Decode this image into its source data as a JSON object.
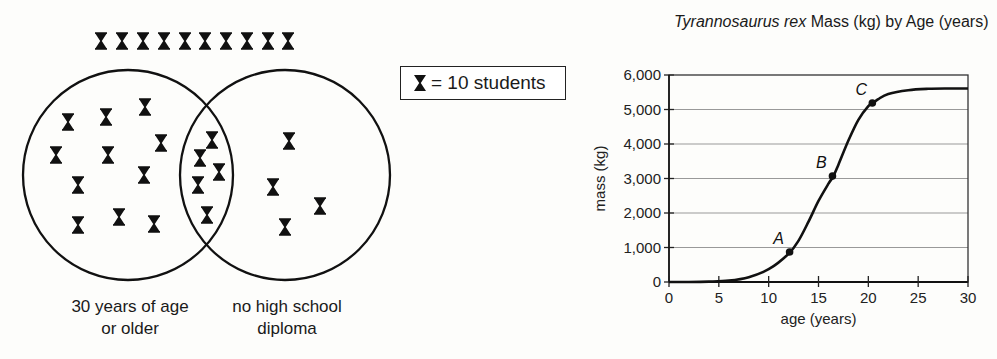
{
  "venn": {
    "legend": {
      "icon": "hourglass-student-icon",
      "text": "= 10 students"
    },
    "outside_count_icons": 10,
    "sets": [
      {
        "label_line1": "30 years of age",
        "label_line2": "or older",
        "only_icons": 11
      },
      {
        "label_line1": "no high school",
        "label_line2": "diploma",
        "only_icons": 4
      }
    ],
    "overlap_icons": 5,
    "icons": {
      "outside": [
        [
          101,
          41
        ],
        [
          122,
          41
        ],
        [
          143,
          41
        ],
        [
          164,
          41
        ],
        [
          185,
          41
        ],
        [
          205,
          41
        ],
        [
          226,
          41
        ],
        [
          247,
          41
        ],
        [
          268,
          41
        ],
        [
          288,
          41
        ]
      ],
      "left_only": [
        [
          68,
          122
        ],
        [
          106,
          117
        ],
        [
          145,
          107
        ],
        [
          161,
          143
        ],
        [
          56,
          155
        ],
        [
          108,
          155
        ],
        [
          144,
          175
        ],
        [
          78,
          185
        ],
        [
          78,
          225
        ],
        [
          119,
          217
        ],
        [
          154,
          224
        ]
      ],
      "overlap": [
        [
          212,
          140
        ],
        [
          200,
          158
        ],
        [
          219,
          172
        ],
        [
          198,
          185
        ],
        [
          207,
          215
        ]
      ],
      "right_only": [
        [
          289,
          141
        ],
        [
          273,
          187
        ],
        [
          320,
          206
        ],
        [
          285,
          227
        ]
      ]
    }
  },
  "chart_data": {
    "type": "line",
    "title_italic": "Tyrannosaurus rex",
    "title_rest": " Mass (kg) by Age (years)",
    "title": "Tyrannosaurus rex Mass (kg) by Age (years)",
    "xlabel": "age (years)",
    "ylabel": "mass (kg)",
    "xlim": [
      0,
      30
    ],
    "ylim": [
      0,
      6000
    ],
    "xticks": [
      0,
      5,
      10,
      15,
      20,
      25,
      30
    ],
    "yticks": [
      0,
      1000,
      2000,
      3000,
      4000,
      5000,
      6000
    ],
    "ytick_labels": [
      "0",
      "1,000",
      "2,000",
      "3,000",
      "4,000",
      "5,000",
      "6,000"
    ],
    "grid": "horizontal",
    "series": [
      {
        "name": "T. rex mass",
        "x": [
          0,
          2,
          4,
          6,
          8,
          10,
          12,
          13,
          14,
          15,
          16,
          16.5,
          17,
          18,
          19,
          20,
          20.5,
          21,
          22,
          24,
          26,
          28,
          30
        ],
        "values": [
          0,
          0,
          10,
          40,
          140,
          370,
          820,
          1200,
          1750,
          2350,
          2850,
          3070,
          3400,
          4100,
          4700,
          5100,
          5190,
          5300,
          5450,
          5560,
          5600,
          5610,
          5610
        ]
      }
    ],
    "annotations": [
      {
        "label": "A",
        "x": 12.1,
        "y": 870
      },
      {
        "label": "B",
        "x": 16.4,
        "y": 3070
      },
      {
        "label": "C",
        "x": 20.4,
        "y": 5190
      }
    ]
  }
}
